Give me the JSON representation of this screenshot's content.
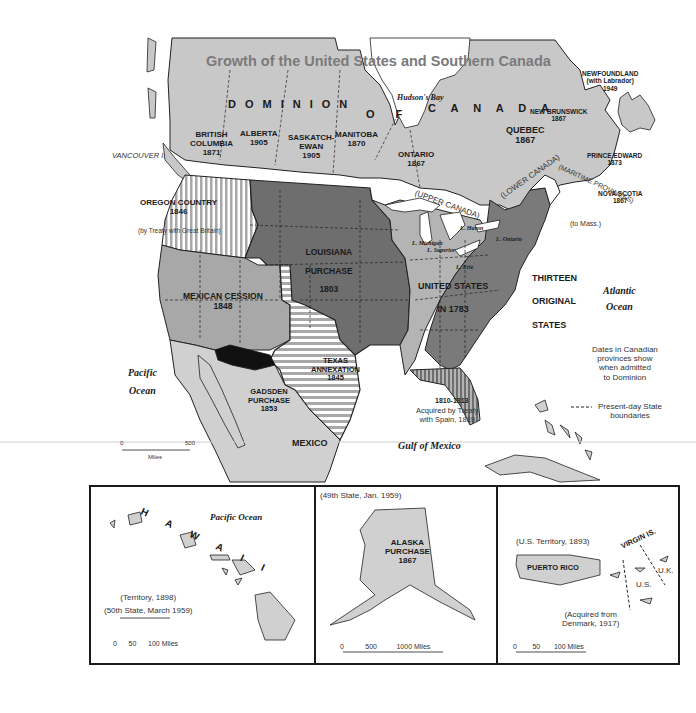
{
  "title": "Growth of the United States and Southern Canada",
  "canada": {
    "dominion_words": [
      "D",
      "O",
      "M",
      "I",
      "N",
      "I",
      "O",
      "N",
      "O F",
      "C A N A D A"
    ],
    "provinces": [
      {
        "name": "BRITISH\nCOLUMBIA",
        "year": "1871"
      },
      {
        "name": "ALBERTA",
        "year": "1905"
      },
      {
        "name": "SASKATCH-\nEWAN",
        "year": "1905"
      },
      {
        "name": "MANITOBA",
        "year": "1870"
      },
      {
        "name": "ONTARIO",
        "year": "1867"
      },
      {
        "name": "QUEBEC",
        "year": "1867"
      },
      {
        "name": "NEW BRUNSWICK",
        "year": "1867"
      },
      {
        "name": "NEWFOUNDLAND\n(with Labrador)",
        "year": "1949"
      },
      {
        "name": "PRINCE EDWARD",
        "year": "1873"
      },
      {
        "name": "NOVA SCOTIA",
        "year": "1867"
      }
    ],
    "historic_regions": [
      "(UPPER CANADA)",
      "(LOWER CANADA)",
      "(MARITIME PROVINCES)"
    ],
    "water": [
      "Hudson's Bay",
      "St. Lawrence R."
    ],
    "islands": [
      "VANCOUVER I."
    ]
  },
  "territories": [
    {
      "name": "OREGON COUNTRY",
      "year": "1846",
      "note": "(by Treaty with Great Britain)"
    },
    {
      "name": "LOUISIANA\nPURCHASE",
      "year": "1803"
    },
    {
      "name": "MEXICAN CESSION",
      "year": "1848"
    },
    {
      "name": "TEXAS\nANNEXATION",
      "year": "1845"
    },
    {
      "name": "GADSDEN\nPURCHASE",
      "year": "1853"
    },
    {
      "name": "UNITED STATES\nIN 1783"
    },
    {
      "name": "THIRTEEN\nORIGINAL\nSTATES"
    },
    {
      "name": "1810-1813"
    },
    {
      "name": "Acquired by Treaty\nwith Spain, 1819"
    },
    {
      "name": "(to Mass.)"
    }
  ],
  "lakes": [
    "L. Superior",
    "L. Michigan",
    "L. Huron",
    "L. Ontario",
    "L. Erie"
  ],
  "water_labels": {
    "pacific": "Pacific\nOcean",
    "atlantic": "Atlantic\nOcean",
    "gulf": "Gulf of Mexico"
  },
  "country_labels": {
    "mexico": "MEXICO"
  },
  "notes": {
    "canadian_dates": "Dates in Canadian\nprovinces show\nwhen admitted\nto Dominion",
    "legend_boundaries": "Present-day State\nboundaries"
  },
  "main_scale": {
    "ticks": [
      "0",
      "500"
    ],
    "unit": "Miles"
  },
  "insets": {
    "hawaii": {
      "ocean": "Pacific Ocean",
      "letters": [
        "H",
        "A",
        "W",
        "A",
        "I",
        "I"
      ],
      "status": "(Territory, 1898)\n(50th State, March 1959)",
      "scale": {
        "ticks": [
          "0",
          "50",
          "100"
        ],
        "unit": "Miles"
      }
    },
    "alaska": {
      "status": "(49th State, Jan. 1959)",
      "name": "ALASKA\nPURCHASE\n1867",
      "scale": {
        "ticks": [
          "0",
          "500",
          "1000"
        ],
        "unit": "Miles"
      }
    },
    "puerto_rico": {
      "status": "(U.S. Territory, 1893)",
      "name": "PUERTO RICO",
      "virgin": "VIRGIN IS.",
      "uk": "U.K.",
      "us": "U.S.",
      "acquired": "(Acquired from\nDenmark, 1917)",
      "scale": {
        "ticks": [
          "0",
          "50",
          "100"
        ],
        "unit": "Miles"
      }
    }
  },
  "colors": {
    "canada": "#c8c8c8",
    "louisiana": "#6e6e6e",
    "thirteen": "#7a7a7a",
    "us1783": "#b4b4b4",
    "mexican_cession": "#a8a8a8",
    "gadsden": "#111111",
    "mexico": "#d0d0d0",
    "water": "#ffffff"
  }
}
